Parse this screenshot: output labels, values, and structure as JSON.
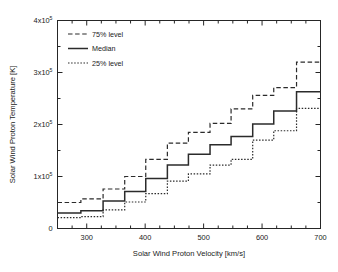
{
  "figure": {
    "background": "#ffffff",
    "ink_color": "#2b2b2b"
  },
  "axes": {
    "x_title": "Solar Wind Proton Velocity [km/s]",
    "y_title": "Solar Wind Proton Temperature [K]",
    "x_ticks": [
      "300",
      "400",
      "500",
      "600",
      "700"
    ],
    "y_ticks": [
      {
        "zero": "0"
      },
      {
        "mantissa": "1x10",
        "exponent": "5"
      },
      {
        "mantissa": "2x10",
        "exponent": "5"
      },
      {
        "mantissa": "3x10",
        "exponent": "5"
      },
      {
        "mantissa": "4x10",
        "exponent": "5"
      }
    ]
  },
  "legend": {
    "items": [
      {
        "label": "75% level",
        "style": "dashed"
      },
      {
        "label": "Median",
        "style": "solid"
      },
      {
        "label": "25% level",
        "style": "dotted"
      }
    ]
  },
  "chart_data": {
    "type": "line",
    "drawstyle": "steps-post",
    "title": "",
    "xlabel": "Solar Wind Proton Velocity [km/s]",
    "ylabel": "Solar Wind Proton Temperature [K]",
    "xlim": [
      250,
      700
    ],
    "ylim": [
      0,
      400000
    ],
    "xticks": [
      300,
      400,
      500,
      600,
      700
    ],
    "yticks": [
      0,
      100000,
      200000,
      300000,
      400000
    ],
    "grid": false,
    "legend_position": "upper-left-inside",
    "bin_edges": [
      250,
      290,
      328,
      365,
      401,
      438,
      474,
      511,
      547,
      584,
      620,
      659,
      700
    ],
    "series": [
      {
        "name": "75% level",
        "style": "dashed",
        "values": [
          50000,
          57000,
          76000,
          100000,
          133000,
          164000,
          185000,
          202000,
          230000,
          256000,
          271000,
          320000
        ]
      },
      {
        "name": "Median",
        "style": "solid",
        "values": [
          30000,
          34000,
          53000,
          71000,
          96000,
          122000,
          143000,
          161000,
          177000,
          201000,
          226000,
          263000
        ]
      },
      {
        "name": "25% level",
        "style": "dotted",
        "values": [
          21000,
          23000,
          36000,
          51000,
          67000,
          91000,
          105000,
          122000,
          133000,
          170000,
          188000,
          231000
        ]
      }
    ]
  }
}
